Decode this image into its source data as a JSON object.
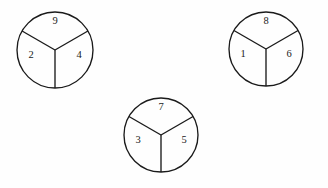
{
  "figure": {
    "background_color": "#fefefe",
    "stroke_color": "#1a1a1a",
    "label_color": "#1a1a1a",
    "circles": [
      {
        "name": "circle-left",
        "center_x": 55,
        "center_y": 50,
        "radius": 38,
        "sectors": [
          {
            "name": "top",
            "value": "9",
            "label_x": 55,
            "label_y": 22
          },
          {
            "name": "left",
            "value": "2",
            "label_x": 31,
            "label_y": 56
          },
          {
            "name": "right",
            "value": "4",
            "label_x": 79,
            "label_y": 56
          }
        ]
      },
      {
        "name": "circle-right",
        "center_x": 266,
        "center_y": 49,
        "radius": 37,
        "sectors": [
          {
            "name": "top",
            "value": "8",
            "label_x": 266,
            "label_y": 22
          },
          {
            "name": "left",
            "value": "1",
            "label_x": 243,
            "label_y": 55
          },
          {
            "name": "right",
            "value": "6",
            "label_x": 289,
            "label_y": 55
          }
        ]
      },
      {
        "name": "circle-bottom",
        "center_x": 161,
        "center_y": 135,
        "radius": 37,
        "sectors": [
          {
            "name": "top",
            "value": "7",
            "label_x": 161,
            "label_y": 108
          },
          {
            "name": "left",
            "value": "3",
            "label_x": 138,
            "label_y": 141
          },
          {
            "name": "right",
            "value": "5",
            "label_x": 184,
            "label_y": 141
          }
        ]
      }
    ]
  },
  "chart_data": {
    "type": "pie",
    "title": "",
    "xlabel": "",
    "ylabel": "",
    "grid": false,
    "legend": "none",
    "charts": [
      {
        "name": "circle-left",
        "categories": [
          "top",
          "left",
          "right"
        ],
        "labels": [
          "9",
          "2",
          "4"
        ],
        "values": [
          33.33,
          33.33,
          33.33
        ]
      },
      {
        "name": "circle-right",
        "categories": [
          "top",
          "left",
          "right"
        ],
        "labels": [
          "8",
          "1",
          "6"
        ],
        "values": [
          33.33,
          33.33,
          33.33
        ]
      },
      {
        "name": "circle-bottom",
        "categories": [
          "top",
          "left",
          "right"
        ],
        "labels": [
          "7",
          "3",
          "5"
        ],
        "values": [
          33.33,
          33.33,
          33.33
        ]
      }
    ]
  }
}
